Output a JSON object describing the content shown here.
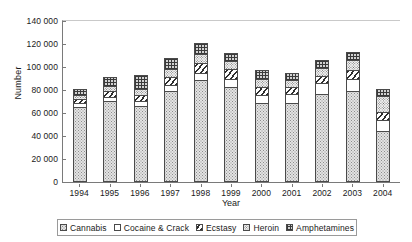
{
  "chart_data": {
    "type": "bar",
    "stacked": true,
    "title": "",
    "xlabel": "Year",
    "ylabel": "Number",
    "ylim": [
      0,
      140000
    ],
    "ytick_step": 20000,
    "ytick_labels": [
      "140 000",
      "120 000",
      "100 000",
      "80 000",
      "60 000",
      "40 000",
      "20 000",
      "0"
    ],
    "ytick_values": [
      140000,
      120000,
      100000,
      80000,
      60000,
      40000,
      20000,
      0
    ],
    "grid": false,
    "legend_position": "bottom",
    "categories": [
      "1994",
      "1995",
      "1996",
      "1997",
      "1998",
      "1999",
      "2000",
      "2001",
      "2002",
      "2003",
      "2004"
    ],
    "series": [
      {
        "name": "Cannabis",
        "fill": "cannabis",
        "values": [
          68000,
          72500,
          68000,
          81000,
          91000,
          85000,
          71000,
          71000,
          79000,
          81000,
          46000
        ]
      },
      {
        "name": "Cocaine & Crack",
        "fill": "cocaine",
        "values": [
          2500,
          3000,
          3500,
          4500,
          5500,
          6500,
          6500,
          7000,
          8500,
          10000,
          9000
        ]
      },
      {
        "name": "Ecstasy",
        "fill": "ecstasy",
        "values": [
          3000,
          4500,
          5000,
          6500,
          8000,
          7500,
          6000,
          5500,
          6000,
          7500,
          6500
        ]
      },
      {
        "name": "Heroin",
        "fill": "heroin",
        "values": [
          3000,
          4000,
          5000,
          6500,
          7500,
          6500,
          6500,
          5500,
          6000,
          8000,
          13500
        ]
      },
      {
        "name": "Amphetamines",
        "fill": "amphetamines",
        "values": [
          4500,
          7000,
          11500,
          9500,
          9000,
          6500,
          7000,
          6000,
          6500,
          6500,
          6000
        ]
      }
    ],
    "totals": [
      81000,
      91000,
      93000,
      108000,
      121000,
      112000,
      97000,
      95000,
      106000,
      113000,
      81000
    ]
  },
  "legend": {
    "items": [
      {
        "label": "Cannabis"
      },
      {
        "label": "Cocaine & Crack"
      },
      {
        "label": "Ecstasy"
      },
      {
        "label": "Heroin"
      },
      {
        "label": "Amphetamines"
      }
    ]
  }
}
